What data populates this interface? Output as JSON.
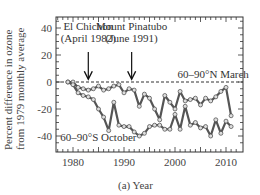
{
  "chart_data": {
    "type": "line",
    "title": "",
    "xlabel": "(a) Year",
    "ylabel_lines": [
      "Percent difference in ozone",
      "from 1979 monthly average"
    ],
    "xlim": [
      1977,
      2012
    ],
    "ylim": [
      -50,
      48
    ],
    "x_ticks": [
      1980,
      1990,
      2000,
      2010
    ],
    "y_ticks": [
      40,
      20,
      0,
      -20,
      -40
    ],
    "grid": false,
    "reference_line": {
      "y": 0,
      "style": "dashed"
    },
    "annotations": [
      {
        "text_lines": [
          "El Chichon",
          "(April 1982)"
        ],
        "arrow_x": 1983,
        "arrow_y": 2
      },
      {
        "text_lines": [
          "Mount Pinatubo",
          "(June 1991)"
        ],
        "arrow_x": 1991.5,
        "arrow_y": 2
      }
    ],
    "x": [
      1979,
      1980,
      1981,
      1982,
      1983,
      1984,
      1985,
      1986,
      1987,
      1988,
      1989,
      1990,
      1991,
      1992,
      1993,
      1994,
      1995,
      1996,
      1997,
      1998,
      1999,
      2000,
      2001,
      2002,
      2003,
      2004,
      2005,
      2006,
      2007,
      2008,
      2009,
      2010,
      2011
    ],
    "series": [
      {
        "name": "60–90°N March",
        "label_pos": {
          "x": 2000.5,
          "y": 3
        },
        "values": [
          0,
          0,
          -4,
          -5,
          -6,
          -5,
          -3,
          -6,
          -5,
          -3,
          -2,
          -8,
          -5,
          -6,
          -18,
          -9,
          -12,
          -20,
          -28,
          -10,
          -15,
          -20,
          -7,
          -14,
          -13,
          -12,
          -17,
          -12,
          -14,
          -11,
          -7,
          -4,
          -25
        ]
      },
      {
        "name": "60–90°S October",
        "label_pos": {
          "x": 1977.5,
          "y": -44
        },
        "values": [
          0,
          -2,
          -8,
          -10,
          -11,
          -13,
          -20,
          -26,
          -36,
          -15,
          -32,
          -33,
          -33,
          -37,
          -40,
          -38,
          -33,
          -32,
          -32,
          -35,
          -35,
          -24,
          -35,
          -18,
          -32,
          -30,
          -34,
          -33,
          -40,
          -28,
          -38,
          -29,
          -33
        ]
      }
    ]
  },
  "labels": {
    "ylabel_line1": "Percent difference in ozone",
    "ylabel_line2": "from 1979 monthly average",
    "xlabel": "(a) Year"
  }
}
